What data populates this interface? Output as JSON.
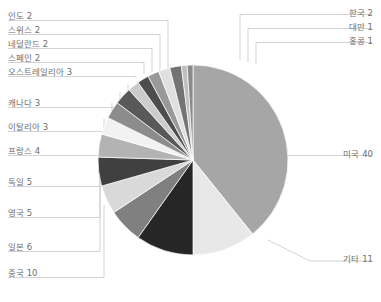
{
  "chart_data": {
    "type": "pie",
    "title": "",
    "subtitle": "",
    "xlabel": "",
    "ylabel": "",
    "legend_position": "callout-labels",
    "grid": false,
    "total": 101,
    "start_angle_deg": 0,
    "direction": "clockwise",
    "categories": [
      "미국",
      "기타",
      "중국",
      "일본",
      "영국",
      "독일",
      "프랑스",
      "이탈리아",
      "캐나다",
      "오스트레일리아",
      "스페인",
      "네덜란드",
      "스위스",
      "인도",
      "한국",
      "대만",
      "홍콩"
    ],
    "values": [
      40,
      11,
      10,
      6,
      5,
      5,
      4,
      3,
      3,
      3,
      2,
      2,
      2,
      2,
      2,
      1,
      1
    ],
    "slices": [
      {
        "label": "미국 40",
        "name": "미국",
        "value": 40,
        "color": "#a6a6a6"
      },
      {
        "label": "기타 11",
        "name": "기타",
        "value": 11,
        "color": "#e8e8e8"
      },
      {
        "label": "중국 10",
        "name": "중국",
        "value": 10,
        "color": "#262626"
      },
      {
        "label": "일본 6",
        "name": "일본",
        "value": 6,
        "color": "#808080"
      },
      {
        "label": "영국 5",
        "name": "영국",
        "value": 5,
        "color": "#d9d9d9"
      },
      {
        "label": "독일 5",
        "name": "독일",
        "value": 5,
        "color": "#404040"
      },
      {
        "label": "프랑스 4",
        "name": "프랑스",
        "value": 4,
        "color": "#b3b3b3"
      },
      {
        "label": "이탈리아 3",
        "name": "이탈리아",
        "value": 3,
        "color": "#f2f2f2"
      },
      {
        "label": "캐나다 3",
        "name": "캐나다",
        "value": 3,
        "color": "#8c8c8c"
      },
      {
        "label": "오스트레일리아 3",
        "name": "오스트레일리아",
        "value": 3,
        "color": "#595959"
      },
      {
        "label": "스페인 2",
        "name": "스페인",
        "value": 2,
        "color": "#cccccc"
      },
      {
        "label": "네덜란드 2",
        "name": "네덜란드",
        "value": 2,
        "color": "#4d4d4d"
      },
      {
        "label": "스위스 2",
        "name": "스위스",
        "value": 2,
        "color": "#999999"
      },
      {
        "label": "인도 2",
        "name": "인도",
        "value": 2,
        "color": "#e0e0e0"
      },
      {
        "label": "한국 2",
        "name": "한국",
        "value": 2,
        "color": "#737373"
      },
      {
        "label": "대만 1",
        "name": "대만",
        "value": 1,
        "color": "#bfbfbf"
      },
      {
        "label": "홍콩 1",
        "name": "홍콩",
        "value": 1,
        "color": "#8a8a8a"
      }
    ]
  },
  "labels": {
    "left": [
      {
        "text": "인도 2",
        "key": "india"
      },
      {
        "text": "스위스 2",
        "key": "switzerland"
      },
      {
        "text": "네덜란드 2",
        "key": "netherlands"
      },
      {
        "text": "스페인 2",
        "key": "spain"
      },
      {
        "text": "오스트레일리아 3",
        "key": "australia"
      },
      {
        "text": "캐나다 3",
        "key": "canada"
      },
      {
        "text": "이탈리아 3",
        "key": "italy"
      },
      {
        "text": "프랑스 4",
        "key": "france"
      },
      {
        "text": "독일 5",
        "key": "germany"
      },
      {
        "text": "영국 5",
        "key": "uk"
      },
      {
        "text": "일본 6",
        "key": "japan"
      },
      {
        "text": "중국 10",
        "key": "china"
      }
    ],
    "right": [
      {
        "text": "한국 2",
        "key": "korea"
      },
      {
        "text": "대만 1",
        "key": "taiwan"
      },
      {
        "text": "홍콩 1",
        "key": "hongkong"
      },
      {
        "text": "미국 40",
        "key": "usa"
      },
      {
        "text": "기타 11",
        "key": "others"
      }
    ]
  },
  "colors": {
    "leader_line": "#c8c8c8",
    "label_text": "#6e6e6e",
    "background": "#ffffff"
  }
}
